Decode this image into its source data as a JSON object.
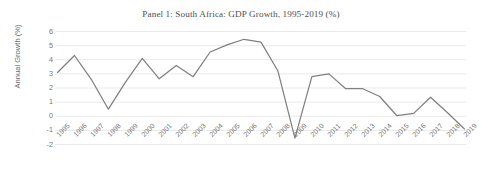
{
  "chart_data": {
    "type": "line",
    "title": "Panel 1: South Africa: GDP Growth, 1995-2019 (%)",
    "xlabel": "",
    "ylabel": "Annual Growth (%)",
    "ylim": [
      -2,
      6
    ],
    "yticks": [
      6,
      5,
      4,
      3,
      2,
      1,
      0,
      -1,
      -2
    ],
    "ytick_labels": [
      "6",
      "5",
      "4",
      "3",
      "2",
      "1",
      "0",
      "-1",
      "-2"
    ],
    "grid": true,
    "legend": "none",
    "line_color": "#808080",
    "categories": [
      "1995",
      "1996",
      "1997",
      "1998",
      "1999",
      "2000",
      "2001",
      "2002",
      "2003",
      "2004",
      "2005",
      "2006",
      "2007",
      "2008",
      "2009",
      "2010",
      "2011",
      "2012",
      "2013",
      "2014",
      "2015",
      "2016",
      "2017",
      "2018",
      "2019"
    ],
    "series": [
      {
        "name": "GDP Growth",
        "values": [
          3.1,
          4.3,
          2.6,
          0.5,
          2.4,
          4.1,
          2.65,
          3.6,
          2.8,
          4.55,
          5.05,
          5.45,
          5.25,
          3.2,
          -1.55,
          2.8,
          3.0,
          1.95,
          1.95,
          1.4,
          0.05,
          0.2,
          1.35,
          0.25,
          -0.9
        ]
      }
    ]
  }
}
